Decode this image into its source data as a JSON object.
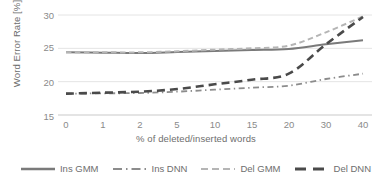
{
  "chart_data": {
    "type": "line",
    "title": "",
    "xlabel": "% of deleted/inserted words",
    "ylabel": "Word Error Rate [%]",
    "categories": [
      "0",
      "1",
      "2",
      "5",
      "10",
      "15",
      "20",
      "30",
      "40"
    ],
    "ylim": [
      15,
      30
    ],
    "yticks": [
      15,
      20,
      25,
      30
    ],
    "grid": "horizontal",
    "legend_position": "bottom",
    "series": [
      {
        "name": "Ins GMM",
        "style": "solid",
        "color": "#7a7a7a",
        "width": 2.0,
        "values": [
          24.4,
          24.35,
          24.3,
          24.45,
          24.6,
          24.75,
          24.9,
          25.6,
          26.2
        ]
      },
      {
        "name": "Ins DNN",
        "style": "dashdot",
        "color": "#8c8c8c",
        "width": 1.8,
        "values": [
          18.2,
          18.25,
          18.3,
          18.5,
          18.8,
          19.1,
          19.4,
          20.4,
          21.2
        ]
      },
      {
        "name": "Del GMM",
        "style": "dashed",
        "color": "#b5b5b5",
        "width": 2.0,
        "values": [
          24.4,
          24.4,
          24.4,
          24.55,
          24.8,
          25.0,
          25.4,
          27.4,
          29.8
        ]
      },
      {
        "name": "Del DNN",
        "style": "dashed-thick",
        "color": "#4a4a4a",
        "width": 2.6,
        "values": [
          18.2,
          18.35,
          18.5,
          18.9,
          19.6,
          20.3,
          21.2,
          25.6,
          29.7
        ]
      }
    ]
  },
  "axes": {
    "y_tick_labels": [
      "30",
      "25",
      "20",
      "15"
    ],
    "x_tick_labels": [
      "0",
      "1",
      "2",
      "5",
      "10",
      "15",
      "20",
      "30",
      "40"
    ]
  },
  "legend": {
    "items": [
      {
        "label": "Ins GMM"
      },
      {
        "label": "Ins DNN"
      },
      {
        "label": "Del GMM"
      },
      {
        "label": "Del DNN"
      }
    ]
  },
  "colors": {
    "grid": "#e2e2e2",
    "text": "#808080",
    "background": "#ffffff"
  }
}
